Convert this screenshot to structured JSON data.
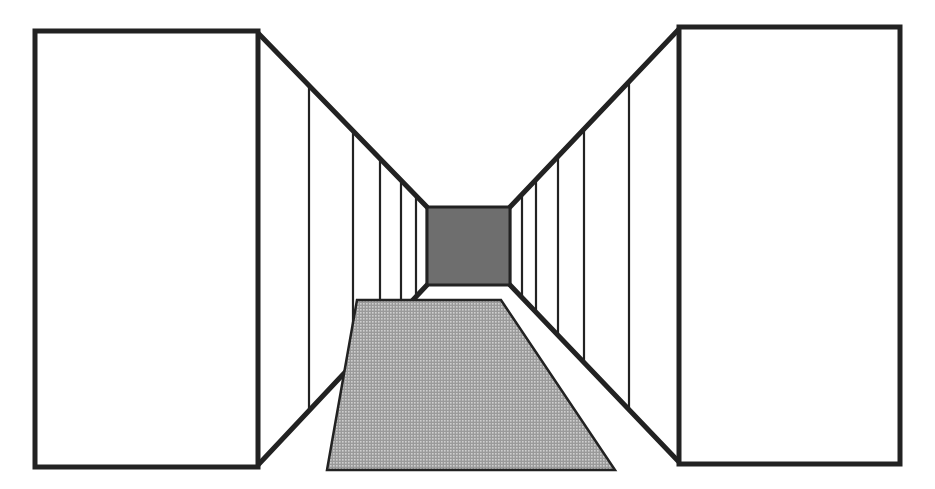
{
  "diagram": {
    "title": "One-point perspective corridor",
    "canvas": {
      "width": 935,
      "height": 489,
      "background": "#ffffff"
    },
    "stroke_color": "#222222",
    "left_box": {
      "x": 35,
      "y": 31,
      "w": 223,
      "h": 436,
      "fill": "#ffffff"
    },
    "right_box": {
      "x": 679,
      "y": 27,
      "w": 221,
      "h": 437,
      "fill": "#ffffff"
    },
    "back_wall": {
      "x": 427,
      "y": 207,
      "w": 83,
      "h": 78,
      "fill": "#6e6e6e"
    },
    "left_wall": {
      "outer_top": [
        258,
        33
      ],
      "outer_bottom": [
        258,
        465
      ],
      "inner_top": [
        427,
        207
      ],
      "inner_bottom": [
        427,
        285
      ],
      "panel_lines_x": [
        309,
        353,
        380,
        401,
        416
      ]
    },
    "right_wall": {
      "outer_top": [
        679,
        29
      ],
      "outer_bottom": [
        679,
        462
      ],
      "inner_top": [
        510,
        207
      ],
      "inner_bottom": [
        510,
        285
      ],
      "panel_lines_x": [
        629,
        584,
        558,
        536,
        522
      ]
    },
    "carpet": {
      "points": [
        [
          357,
          300
        ],
        [
          501,
          300
        ],
        [
          615,
          470
        ],
        [
          327,
          470
        ]
      ],
      "fill": "#a9a9a9",
      "pattern": "fine-grid"
    }
  }
}
